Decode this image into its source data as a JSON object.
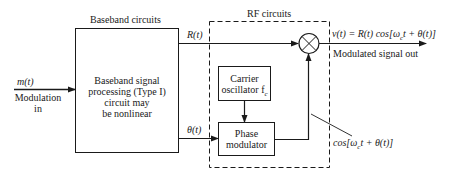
{
  "diagram": {
    "groups": {
      "baseband": {
        "label": "Baseband circuits"
      },
      "rf": {
        "label": "RF circuits"
      }
    },
    "blocks": {
      "baseband_processor": {
        "lines": [
          "Baseband signal",
          "processing (Type I)",
          "circuit may",
          "be nonlinear"
        ]
      },
      "carrier_oscillator": {
        "line1": "Carrier",
        "line2": "oscillator f",
        "line2_sub": "c"
      },
      "phase_modulator": {
        "line1": "Phase",
        "line2": "modulator"
      },
      "multiplier": {
        "symbol": "⊗"
      }
    },
    "signals": {
      "input": {
        "symbol": "m(t)",
        "line1": "Modulation",
        "line2": "in"
      },
      "amplitude": {
        "symbol": "R(t)"
      },
      "phase": {
        "symbol": "θ(t)"
      },
      "output": {
        "equation_a": "v(t) = R(t) cos[ω",
        "equation_sub": "c",
        "equation_b": "t + θ(t)]",
        "label": "Modulated signal out"
      },
      "carrier_annotation": {
        "text_a": "cos[ω",
        "text_sub": "c",
        "text_b": "t + θ(t)]"
      }
    },
    "colors": {
      "line": "#1a1a1a",
      "background": "#ffffff"
    }
  }
}
